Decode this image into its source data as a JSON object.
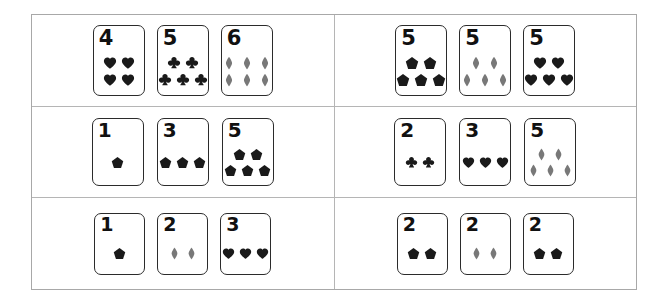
{
  "worksheet": {
    "title": "Counting cards worksheet",
    "suit_colors": {
      "heart": "#1a1a1a",
      "club": "#1a1a1a",
      "pentagon": "#1a1a1a",
      "diamond": "#787878"
    },
    "frame_color": "#a8a8a8",
    "divider_color": "#b5b5b5",
    "card_border_color": "#2b2b2b",
    "background": "#ffffff",
    "rows": [
      {
        "cells": [
          {
            "cards": [
              {
                "number": "4",
                "count": 4,
                "symbol": "heart",
                "layout": [
                  2,
                  2
                ],
                "size": "size-lg"
              },
              {
                "number": "5",
                "count": 5,
                "symbol": "club",
                "layout": [
                  2,
                  3
                ],
                "size": "size-lg"
              },
              {
                "number": "6",
                "count": 6,
                "symbol": "diamond",
                "layout": [
                  3,
                  3
                ],
                "size": "size-lg"
              }
            ]
          },
          {
            "cards": [
              {
                "number": "5",
                "count": 5,
                "symbol": "pentagon",
                "layout": [
                  2,
                  3
                ],
                "size": "size-lg"
              },
              {
                "number": "5",
                "count": 5,
                "symbol": "diamond",
                "layout": [
                  2,
                  3
                ],
                "size": "size-lg"
              },
              {
                "number": "5",
                "count": 5,
                "symbol": "heart",
                "layout": [
                  2,
                  3
                ],
                "size": "size-lg"
              }
            ]
          }
        ]
      },
      {
        "cells": [
          {
            "cards": [
              {
                "number": "1",
                "count": 1,
                "symbol": "pentagon",
                "layout": [
                  1
                ],
                "size": "size-md"
              },
              {
                "number": "3",
                "count": 3,
                "symbol": "pentagon",
                "layout": [
                  3
                ],
                "size": "size-md"
              },
              {
                "number": "5",
                "count": 5,
                "symbol": "pentagon",
                "layout": [
                  2,
                  3
                ],
                "size": "size-md"
              }
            ]
          },
          {
            "cards": [
              {
                "number": "2",
                "count": 2,
                "symbol": "club",
                "layout": [
                  2
                ],
                "size": "size-md"
              },
              {
                "number": "3",
                "count": 3,
                "symbol": "heart",
                "layout": [
                  3
                ],
                "size": "size-md"
              },
              {
                "number": "5",
                "count": 5,
                "symbol": "diamond",
                "layout": [
                  2,
                  3
                ],
                "size": "size-md"
              }
            ]
          }
        ]
      },
      {
        "cells": [
          {
            "cards": [
              {
                "number": "1",
                "count": 1,
                "symbol": "pentagon",
                "layout": [
                  1
                ],
                "size": "size-sm"
              },
              {
                "number": "2",
                "count": 2,
                "symbol": "diamond",
                "layout": [
                  2
                ],
                "size": "size-sm"
              },
              {
                "number": "3",
                "count": 3,
                "symbol": "heart",
                "layout": [
                  3
                ],
                "size": "size-sm"
              }
            ]
          },
          {
            "cards": [
              {
                "number": "2",
                "count": 2,
                "symbol": "pentagon",
                "layout": [
                  2
                ],
                "size": "size-sm"
              },
              {
                "number": "2",
                "count": 2,
                "symbol": "diamond",
                "layout": [
                  2
                ],
                "size": "size-sm"
              },
              {
                "number": "2",
                "count": 2,
                "symbol": "pentagon",
                "layout": [
                  2
                ],
                "size": "size-sm"
              }
            ]
          }
        ]
      }
    ]
  }
}
